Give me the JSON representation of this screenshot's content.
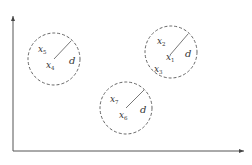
{
  "diagram": {
    "type": "clustering-neighborhood",
    "colors": {
      "stroke": "#555555",
      "text": "#333333",
      "axis": "#555555"
    },
    "axes": {
      "origin": [
        13,
        151
      ],
      "y_end": [
        13,
        16
      ],
      "x_end": [
        244,
        151
      ]
    },
    "radius_label": "d",
    "clusters": [
      {
        "id": "A",
        "center": [
          54,
          59
        ],
        "radius": 26,
        "radius_line": [
          [
            54,
            59
          ],
          [
            71,
            41
          ]
        ],
        "points": [
          {
            "base": "x",
            "sub": "5",
            "pos": [
              38,
              52
            ]
          },
          {
            "base": "x",
            "sub": "4",
            "pos": [
              46,
              68
            ]
          }
        ],
        "d_pos": [
          69,
          64
        ]
      },
      {
        "id": "B",
        "center": [
          171,
          52
        ],
        "radius": 26,
        "radius_line": [
          [
            170,
            55
          ],
          [
            188,
            34
          ]
        ],
        "points": [
          {
            "base": "x",
            "sub": "2",
            "pos": [
              157,
              44
            ]
          },
          {
            "base": "x",
            "sub": "1",
            "pos": [
              166,
              60
            ]
          },
          {
            "base": "x",
            "sub": "3",
            "pos": [
              154,
              72
            ]
          }
        ],
        "d_pos": [
          185,
          57
        ]
      },
      {
        "id": "C",
        "center": [
          126,
          108
        ],
        "radius": 26,
        "radius_line": [
          [
            126,
            108
          ],
          [
            144,
            90
          ]
        ],
        "points": [
          {
            "base": "x",
            "sub": "7",
            "pos": [
              110,
              102
            ]
          },
          {
            "base": "x",
            "sub": "6",
            "pos": [
              119,
              118
            ]
          }
        ],
        "d_pos": [
          140,
          113
        ]
      }
    ]
  }
}
